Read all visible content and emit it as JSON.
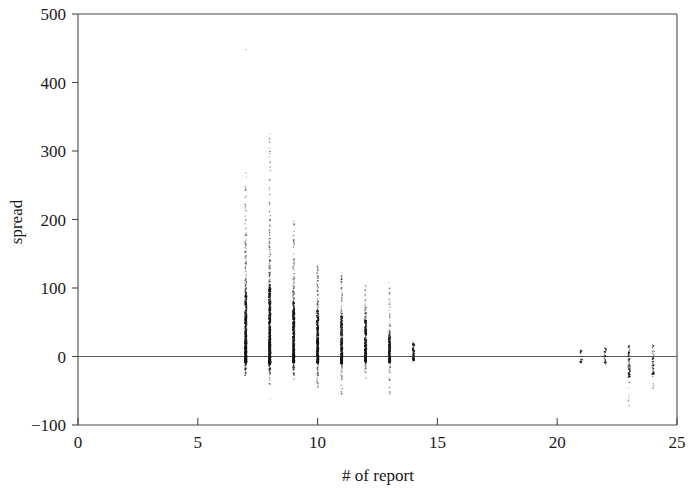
{
  "chart_data": {
    "type": "scatter",
    "title": "",
    "xlabel": "# of report",
    "ylabel": "spread",
    "xlim": [
      0,
      25
    ],
    "ylim": [
      -100,
      500
    ],
    "xticks": [
      0,
      5,
      10,
      15,
      20,
      25
    ],
    "yticks": [
      -100,
      0,
      100,
      200,
      300,
      400,
      500
    ],
    "xticklabels": [
      "0",
      "5",
      "10",
      "15",
      "20",
      "25"
    ],
    "yticklabels": [
      "-100",
      "0",
      "100",
      "200",
      "300",
      "400",
      "500"
    ],
    "grid": false,
    "legend": null,
    "zero_reference_line": 0,
    "marker": "dot",
    "marker_color": "#161616",
    "series": [
      {
        "name": "spread by # of report",
        "groups": [
          {
            "x": 7,
            "n": 520,
            "ymin": -28,
            "ymax": 272,
            "core_low": -8,
            "core_high": 92,
            "outliers": [
              448,
              268,
              262,
              232,
              205,
              198,
              186,
              170,
              158,
              147,
              139,
              131,
              124,
              118,
              112
            ]
          },
          {
            "x": 8,
            "n": 610,
            "ymin": -42,
            "ymax": 325,
            "core_low": -10,
            "core_high": 100,
            "outliers": [
              325,
              318,
              258,
              243,
              237,
              222,
              212,
              200,
              190,
              181,
              172,
              165,
              156,
              149,
              141,
              133,
              126,
              119,
              113,
              -62
            ]
          },
          {
            "x": 9,
            "n": 430,
            "ymin": -34,
            "ymax": 198,
            "core_low": -8,
            "core_high": 78,
            "outliers": [
              198,
              192,
              150,
              142,
              135,
              128,
              121,
              114,
              108,
              101,
              95
            ]
          },
          {
            "x": 10,
            "n": 360,
            "ymin": -48,
            "ymax": 132,
            "core_low": -9,
            "core_high": 66,
            "outliers": [
              132,
              126,
              118,
              110,
              104,
              97,
              90,
              84
            ]
          },
          {
            "x": 11,
            "n": 300,
            "ymin": -58,
            "ymax": 122,
            "core_low": -10,
            "core_high": 58,
            "outliers": [
              122,
              115,
              108,
              100,
              94,
              87,
              80,
              74,
              -52
            ]
          },
          {
            "x": 12,
            "n": 250,
            "ymin": -32,
            "ymax": 104,
            "core_low": -7,
            "core_high": 52,
            "outliers": [
              104,
              97,
              90,
              83,
              77,
              70,
              64
            ]
          },
          {
            "x": 13,
            "n": 210,
            "ymin": -60,
            "ymax": 108,
            "core_low": -8,
            "core_high": 30,
            "outliers": [
              108,
              100,
              92,
              84,
              76,
              68,
              60,
              52,
              45,
              -44,
              -52
            ]
          },
          {
            "x": 14,
            "n": 70,
            "ymin": -8,
            "ymax": 22,
            "core_low": -5,
            "core_high": 18,
            "outliers": []
          },
          {
            "x": 21,
            "n": 16,
            "ymin": -12,
            "ymax": 10,
            "core_low": -8,
            "core_high": 8,
            "outliers": []
          },
          {
            "x": 22,
            "n": 20,
            "ymin": -14,
            "ymax": 14,
            "core_low": -9,
            "core_high": 11,
            "outliers": []
          },
          {
            "x": 23,
            "n": 55,
            "ymin": -72,
            "ymax": 16,
            "core_low": -30,
            "core_high": 14,
            "outliers": [
              -60,
              -66,
              -72
            ]
          },
          {
            "x": 24,
            "n": 38,
            "ymin": -48,
            "ymax": 18,
            "core_low": -26,
            "core_high": 15,
            "outliers": [
              -40,
              -46
            ]
          }
        ]
      }
    ]
  },
  "axes": {
    "x_title": "# of report",
    "y_title": "spread"
  }
}
